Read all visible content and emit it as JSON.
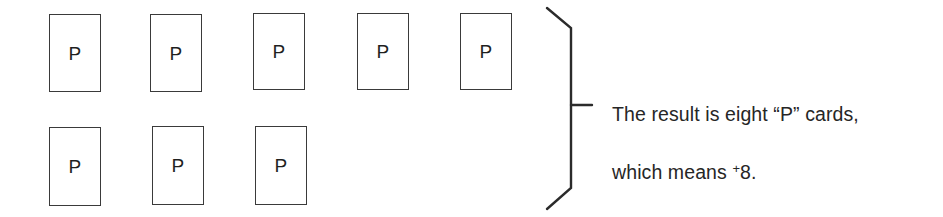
{
  "figure": {
    "background_color": "#ffffff",
    "card_border_color": "#3a3a3a",
    "text_color": "#262626",
    "width": 943,
    "height": 217
  },
  "cards": {
    "label": "P",
    "total_count": 8,
    "rows": [
      {
        "name": "top-row",
        "count": 5,
        "items": [
          {
            "label": "P",
            "x": 49,
            "y": 14,
            "w": 52,
            "h": 78
          },
          {
            "label": "P",
            "x": 150,
            "y": 14,
            "w": 52,
            "h": 78
          },
          {
            "label": "P",
            "x": 253,
            "y": 13,
            "w": 52,
            "h": 77
          },
          {
            "label": "P",
            "x": 357,
            "y": 13,
            "w": 52,
            "h": 77
          },
          {
            "label": "P",
            "x": 460,
            "y": 13,
            "w": 52,
            "h": 77
          }
        ]
      },
      {
        "name": "bottom-row",
        "count": 3,
        "items": [
          {
            "label": "P",
            "x": 49,
            "y": 127,
            "w": 52,
            "h": 79
          },
          {
            "label": "P",
            "x": 152,
            "y": 126,
            "w": 52,
            "h": 79
          },
          {
            "label": "P",
            "x": 255,
            "y": 126,
            "w": 52,
            "h": 79
          }
        ]
      }
    ]
  },
  "brace": {
    "name": "right-curly-brace",
    "orientation": "left-facing",
    "stroke_color": "#2b2b2b"
  },
  "caption": {
    "line1": "The result is eight “P” cards,",
    "line2_before": "which means ",
    "line2_sup": "+",
    "line2_after": "8.",
    "full_text": "The result is eight “P” cards, which means +8."
  }
}
